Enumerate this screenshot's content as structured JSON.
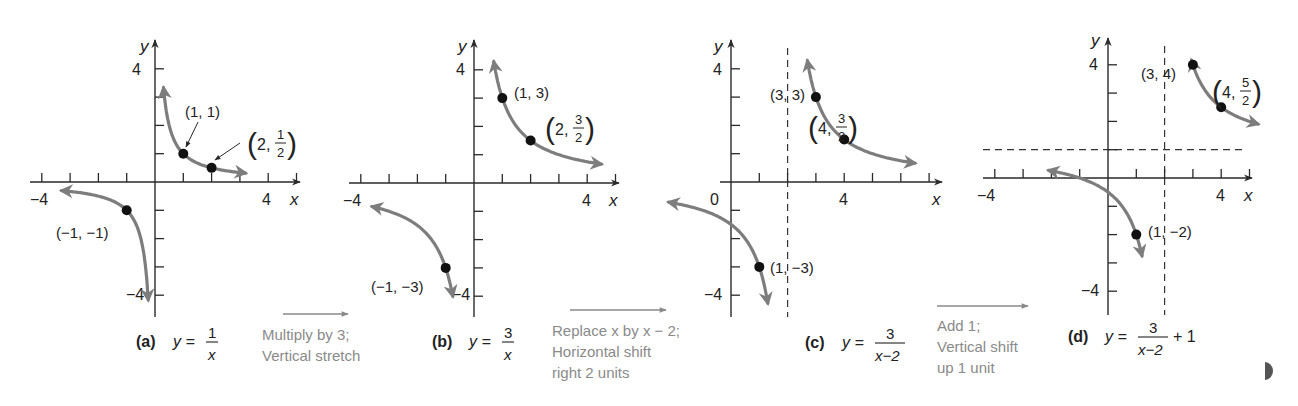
{
  "colors": {
    "axis": "#2a2a2a",
    "curve": "#7d7d7d",
    "point": "#111111",
    "transition_text": "#8a8a8a",
    "asymptote": "#333333",
    "label": "#222222"
  },
  "chart_data": [
    {
      "type": "line",
      "panel": "(a)",
      "title": "(a)  y = 1/x",
      "equation": {
        "lhs": "y =",
        "numerator": "1",
        "denominator": "x",
        "suffix": ""
      },
      "xlabel": "x",
      "ylabel": "y",
      "xlim": [
        -4.4,
        5.1
      ],
      "ylim": [
        -4.6,
        4.6
      ],
      "x_tick_labels": [
        {
          "value": -4,
          "label": "−4"
        },
        {
          "value": 4,
          "label": "4"
        }
      ],
      "y_tick_labels": [
        {
          "value": 4,
          "label": "4"
        },
        {
          "value": -4,
          "label": "−4"
        }
      ],
      "grid": false,
      "function": "1/x",
      "asymptotes": {
        "vertical": null,
        "horizontal": null
      },
      "branches": [
        {
          "x_start": 0.3,
          "x_end": 3.2
        },
        {
          "x_start": -3.3,
          "x_end": -0.24
        }
      ],
      "points": [
        {
          "x": 1,
          "y": 1,
          "label": "(1, 1)"
        },
        {
          "x": 2,
          "y": 0.5,
          "label": "(2, 1/2)"
        },
        {
          "x": -1,
          "y": -1,
          "label": "(−1, −1)"
        }
      ]
    },
    {
      "type": "line",
      "panel": "(b)",
      "title": "(b)  y = 3/x",
      "equation": {
        "lhs": "y =",
        "numerator": "3",
        "denominator": "x",
        "suffix": ""
      },
      "xlabel": "x",
      "ylabel": "y",
      "xlim": [
        -4.4,
        5.1
      ],
      "ylim": [
        -4.6,
        4.6
      ],
      "x_tick_labels": [
        {
          "value": -4,
          "label": "−4"
        },
        {
          "value": 4,
          "label": "4"
        }
      ],
      "y_tick_labels": [
        {
          "value": 4,
          "label": "4"
        },
        {
          "value": -4,
          "label": "−4"
        }
      ],
      "grid": false,
      "function": "3/x",
      "asymptotes": {
        "vertical": null,
        "horizontal": null
      },
      "branches": [
        {
          "x_start": 0.7,
          "x_end": 4.5
        },
        {
          "x_start": -3.6,
          "x_end": -0.75
        }
      ],
      "points": [
        {
          "x": 1,
          "y": 3,
          "label": "(1, 3)"
        },
        {
          "x": 2,
          "y": 1.5,
          "label": "(2, 3/2)"
        },
        {
          "x": -1,
          "y": -3,
          "label": "(−1, −3)"
        }
      ]
    },
    {
      "type": "line",
      "panel": "(c)",
      "title": "(c)  y = 3/(x−2)",
      "equation": {
        "lhs": "y =",
        "numerator": "3",
        "denominator": "x−2",
        "suffix": ""
      },
      "xlabel": "x",
      "ylabel": "y",
      "xlim": [
        -0.4,
        7.5
      ],
      "ylim": [
        -4.6,
        4.6
      ],
      "x_tick_labels": [
        {
          "value": 0,
          "label": "0"
        },
        {
          "value": 4,
          "label": "4"
        }
      ],
      "y_tick_labels": [
        {
          "value": 4,
          "label": "4"
        },
        {
          "value": -4,
          "label": "−4"
        }
      ],
      "grid": false,
      "function": "3/(x-2)",
      "asymptotes": {
        "vertical": 2,
        "horizontal": null
      },
      "branches": [
        {
          "x_start": 2.7,
          "x_end": 6.5
        },
        {
          "x_start": -2.2,
          "x_end": 1.3
        }
      ],
      "points": [
        {
          "x": 3,
          "y": 3,
          "label": "(3, 3)"
        },
        {
          "x": 4,
          "y": 1.5,
          "label": "(4, 3/2)"
        },
        {
          "x": 1,
          "y": -3,
          "label": "(1, −3)"
        }
      ]
    },
    {
      "type": "line",
      "panel": "(d)",
      "title": "(d)  y = 3/(x−2) + 1",
      "equation": {
        "lhs": "y =",
        "numerator": "3",
        "denominator": "x−2",
        "suffix": "+ 1"
      },
      "xlabel": "x",
      "ylabel": "y",
      "xlim": [
        -4.4,
        5.1
      ],
      "ylim": [
        -4.6,
        4.6
      ],
      "x_tick_labels": [
        {
          "value": -4,
          "label": "−4"
        },
        {
          "value": 4,
          "label": "4"
        }
      ],
      "y_tick_labels": [
        {
          "value": 4,
          "label": "4"
        },
        {
          "value": -4,
          "label": "−4"
        }
      ],
      "grid": false,
      "function": "3/(x-2)+1",
      "asymptotes": {
        "vertical": 2,
        "horizontal": 1
      },
      "branches": [
        {
          "x_start": 2.95,
          "x_end": 5.3
        },
        {
          "x_start": -2.1,
          "x_end": 1.2
        }
      ],
      "points": [
        {
          "x": 3,
          "y": 4,
          "label": "(3, 4)"
        },
        {
          "x": 4,
          "y": 2.5,
          "label": "(4, 5/2)"
        },
        {
          "x": 1,
          "y": -2,
          "label": "(1, −2)"
        }
      ]
    }
  ],
  "transitions": [
    {
      "lines": [
        "Multiply by 3;",
        "Vertical stretch"
      ]
    },
    {
      "lines": [
        "Replace x by x − 2;",
        "Horizontal shift",
        "right 2 units"
      ]
    },
    {
      "lines": [
        "Add 1;",
        "Vertical shift",
        "up 1 unit"
      ]
    }
  ],
  "page_marker_icon": "half-circle-marker"
}
